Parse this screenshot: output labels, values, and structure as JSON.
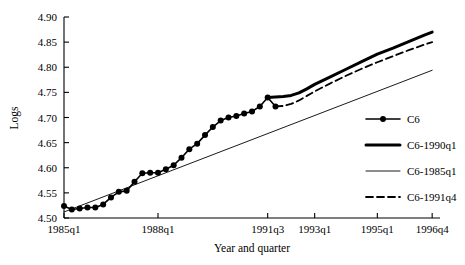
{
  "chart_data": {
    "type": "line",
    "title": "",
    "xlabel": "Year and quarter",
    "ylabel": "Logs",
    "ylim": [
      4.5,
      4.9
    ],
    "yticks": [
      "4.50",
      "4.55",
      "4.60",
      "4.65",
      "4.70",
      "4.75",
      "4.80",
      "4.85",
      "4.90"
    ],
    "ytick_values": [
      4.5,
      4.55,
      4.6,
      4.65,
      4.7,
      4.75,
      4.8,
      4.85,
      4.9
    ],
    "xlim": [
      1985.0,
      1997.0
    ],
    "xticks": [
      "1985q1",
      "1988q1",
      "1991q3",
      "1993q1",
      "1995q1",
      "1996q4"
    ],
    "xtick_values": [
      1985.0,
      1988.0,
      1991.5,
      1993.0,
      1995.0,
      1996.75
    ],
    "grid": false,
    "legend_position": "right",
    "series": [
      {
        "name": "C6",
        "style": "solid-marker",
        "linewidth": 1.6,
        "marker": "circle",
        "color": "#000000",
        "x": [
          1985.0,
          1985.25,
          1985.5,
          1985.75,
          1986.0,
          1986.25,
          1986.5,
          1986.75,
          1987.0,
          1987.25,
          1987.5,
          1987.75,
          1988.0,
          1988.25,
          1988.5,
          1988.75,
          1989.0,
          1989.25,
          1989.5,
          1989.75,
          1990.0,
          1990.25,
          1990.5,
          1990.75,
          1991.0,
          1991.25,
          1991.5,
          1991.75
        ],
        "y": [
          4.524,
          4.517,
          4.519,
          4.521,
          4.521,
          4.527,
          4.541,
          4.552,
          4.554,
          4.572,
          4.589,
          4.59,
          4.59,
          4.597,
          4.605,
          4.62,
          4.637,
          4.648,
          4.665,
          4.681,
          4.694,
          4.7,
          4.703,
          4.708,
          4.712,
          4.722,
          4.74,
          4.722
        ]
      },
      {
        "name": "C6-1990q1",
        "style": "solid-thick",
        "linewidth": 3.0,
        "marker": "none",
        "color": "#000000",
        "x": [
          1991.5,
          1991.75,
          1992.0,
          1992.25,
          1992.5,
          1992.75,
          1993.0,
          1993.5,
          1994.0,
          1994.5,
          1995.0,
          1995.5,
          1996.0,
          1996.5,
          1996.75
        ],
        "y": [
          4.74,
          4.741,
          4.742,
          4.744,
          4.749,
          4.757,
          4.766,
          4.781,
          4.796,
          4.811,
          4.826,
          4.838,
          4.851,
          4.864,
          4.87
        ]
      },
      {
        "name": "C6-1985q1",
        "style": "solid-thin",
        "linewidth": 0.9,
        "marker": "none",
        "color": "#000000",
        "x": [
          1985.0,
          1996.75
        ],
        "y": [
          4.512,
          4.794
        ]
      },
      {
        "name": "C6-1991q4",
        "style": "dashed",
        "linewidth": 1.8,
        "marker": "none",
        "color": "#000000",
        "x": [
          1991.75,
          1992.0,
          1992.25,
          1992.5,
          1992.75,
          1993.0,
          1993.5,
          1994.0,
          1994.5,
          1995.0,
          1995.5,
          1996.0,
          1996.5,
          1996.75
        ],
        "y": [
          4.722,
          4.723,
          4.727,
          4.734,
          4.743,
          4.752,
          4.768,
          4.783,
          4.797,
          4.81,
          4.822,
          4.834,
          4.845,
          4.85
        ]
      }
    ],
    "legend_entries": [
      {
        "label": "C6",
        "style": "solid-marker"
      },
      {
        "label": "C6-1990q1",
        "style": "solid-thick"
      },
      {
        "label": "C6-1985q1",
        "style": "solid-thin"
      },
      {
        "label": "C6-1991q4",
        "style": "dashed"
      }
    ]
  }
}
